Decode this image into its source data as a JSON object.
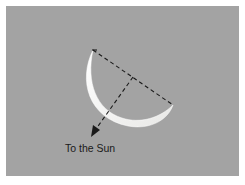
{
  "diagram": {
    "title": "",
    "labels": {
      "sun_direction": "To the Sun"
    },
    "colors": {
      "background": "#a3a3a3",
      "border": "#ffffff",
      "crescent": "#f5f5f3",
      "lines": "#1a1a1a"
    },
    "elements": [
      {
        "type": "crescent",
        "description": "Illuminated crescent (lit limb)"
      },
      {
        "type": "dashed-line",
        "description": "Chord connecting crescent horns"
      },
      {
        "type": "dashed-arrow",
        "description": "Perpendicular from chord midpoint pointing toward the Sun"
      }
    ]
  }
}
